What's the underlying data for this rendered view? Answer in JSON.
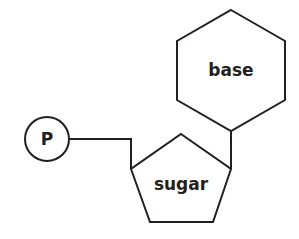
{
  "diagram": {
    "components": {
      "phosphate": {
        "label": "P",
        "shape": "circle"
      },
      "sugar": {
        "label": "sugar",
        "shape": "pentagon"
      },
      "base": {
        "label": "base",
        "shape": "hexagon"
      }
    },
    "connections": [
      {
        "from": "phosphate",
        "to": "sugar"
      },
      {
        "from": "sugar",
        "to": "base"
      }
    ],
    "colors": {
      "stroke": "#231f20",
      "background": "#ffffff"
    }
  }
}
